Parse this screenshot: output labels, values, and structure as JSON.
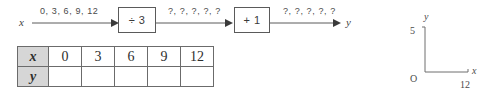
{
  "diagram": {
    "type": "function-machine",
    "input_label": "x",
    "output_label": "y",
    "arrows": [
      {
        "caption": "0, 3, 6, 9, 12"
      },
      {
        "caption": "?, ?, ?, ?, ?"
      },
      {
        "caption": "?, ?, ?, ?, ?"
      }
    ],
    "operations": [
      {
        "label": "÷ 3"
      },
      {
        "label": "+ 1"
      }
    ]
  },
  "table": {
    "rows": [
      {
        "header": "x",
        "cells": [
          "0",
          "3",
          "6",
          "9",
          "12"
        ]
      },
      {
        "header": "y",
        "cells": [
          "",
          "",
          "",
          "",
          ""
        ]
      }
    ]
  },
  "graph": {
    "y_axis_label": "y",
    "x_axis_label": "x",
    "y_tick": "5",
    "x_tick": "12",
    "origin": "O"
  },
  "colors": {
    "ink": "#3a3a3a",
    "rule": "#6b6b6b",
    "header_fill": "#d6d6d6",
    "background": "#ffffff"
  }
}
